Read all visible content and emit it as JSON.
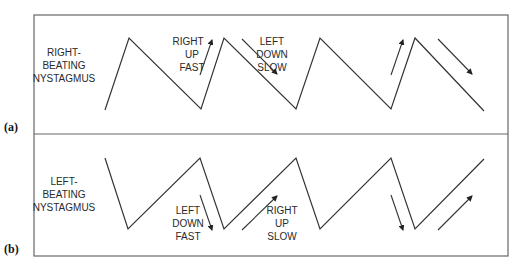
{
  "figure": {
    "panels": [
      {
        "tag": "(a)",
        "title_lines": [
          "RIGHT-",
          "BEATING",
          "NYSTAGMUS"
        ],
        "annotations": [
          {
            "lines": [
              "RIGHT",
              "UP",
              "FAST"
            ],
            "arrow": "up-right"
          },
          {
            "lines": [
              "LEFT",
              "DOWN",
              "SLOW"
            ],
            "arrow": "down-right"
          }
        ]
      },
      {
        "tag": "(b)",
        "title_lines": [
          "LEFT-",
          "BEATING",
          "NYSTAGMUS"
        ],
        "annotations": [
          {
            "lines": [
              "LEFT",
              "DOWN",
              "FAST"
            ],
            "arrow": "down-right"
          },
          {
            "lines": [
              "RIGHT",
              "UP",
              "SLOW"
            ],
            "arrow": "up-right"
          }
        ]
      }
    ],
    "colors": {
      "line": "#333333",
      "frame": "#666666",
      "text": "#2a2a2a"
    }
  }
}
